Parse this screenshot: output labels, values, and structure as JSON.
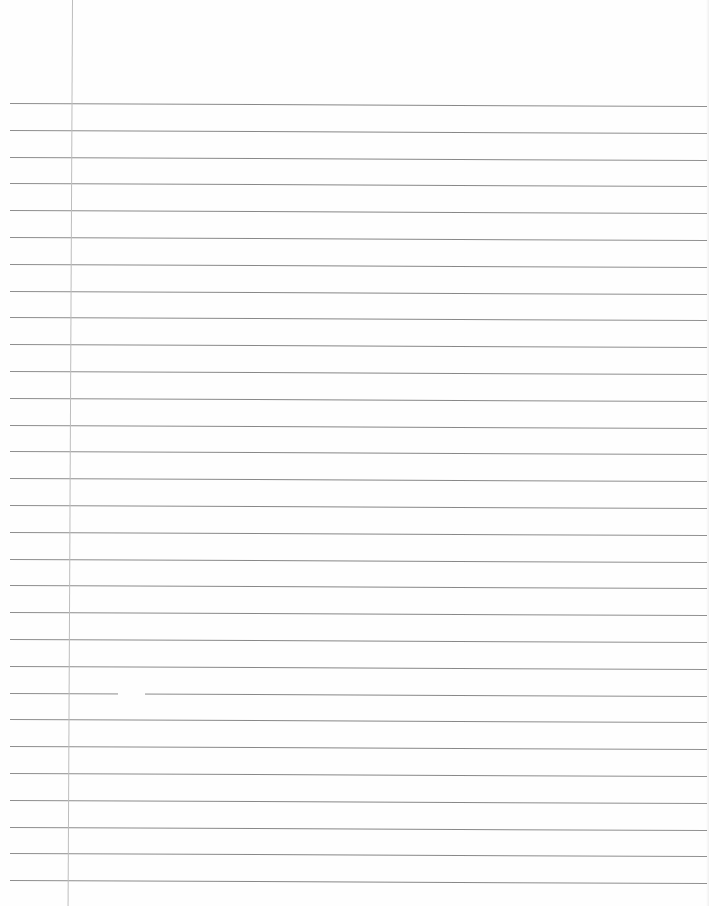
{
  "page": {
    "type": "ruled-notebook-paper",
    "background": "#fefefe",
    "rule_color": "#747474",
    "margin_color": "#bdbdbd"
  },
  "rules": {
    "count": 30,
    "first_y": 103,
    "spacing": 26.8,
    "left_x": 10,
    "right_x": 707
  },
  "margin_line": {
    "x_top": 72,
    "x_bottom": 68
  },
  "line_gap": {
    "line_index": 22,
    "x_start": 118,
    "x_end": 145
  }
}
